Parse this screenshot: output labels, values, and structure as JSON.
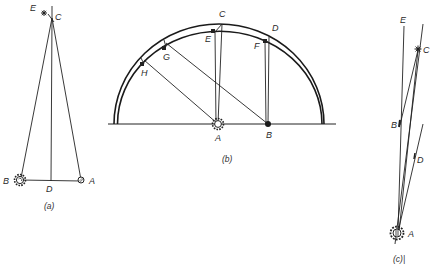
{
  "figure": {
    "panels": [
      {
        "id": "a",
        "caption": "(a)",
        "labels": {
          "E": "E",
          "C": "C",
          "B": "B",
          "D": "D",
          "A": "A"
        },
        "description": "Tall triangle: apex C with star E nearby; base B (sun symbol) – D (foot of altitude) – A (planet symbol)"
      },
      {
        "id": "b",
        "caption": "(b)",
        "labels": {
          "C": "C",
          "D": "D",
          "E": "E",
          "F": "F",
          "G": "G",
          "H": "H",
          "A": "A",
          "B": "B"
        },
        "description": "Two concentric semicircular arcs over a ground line; sun A and point B on ground with parallel sight lines to points on arcs"
      },
      {
        "id": "c",
        "caption": "(c)|",
        "labels": {
          "E": "E",
          "C": "C",
          "B": "B",
          "D": "D",
          "A": "A"
        },
        "description": "Narrow fan of lines from sun A upward through B, D toward star C and E"
      }
    ]
  }
}
